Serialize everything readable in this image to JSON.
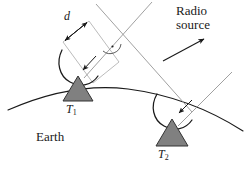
{
  "figure": {
    "width": 250,
    "height": 172,
    "background": "#ffffff"
  },
  "labels": {
    "radio_source_line1": "Radio",
    "radio_source_line2": "source",
    "earth": "Earth",
    "baseline_distance": "d",
    "telescope_1_base": "T",
    "telescope_1_sub": "1",
    "telescope_2_base": "T",
    "telescope_2_sub": "2"
  },
  "colors": {
    "ink": "#1a1a1a",
    "telescope_fill": "#808080",
    "telescope_stroke": "#333333",
    "wavefront_line": "#9a9a9a",
    "ray_line": "#8a8a8a",
    "earth_curve": "#1a1a1a",
    "background": "#ffffff"
  },
  "elements": {
    "earth_curve_name": "earth-surface-arc",
    "telescope_1_name": "telescope-t1",
    "telescope_2_name": "telescope-t2",
    "dish_1_name": "dish-arc-t1",
    "dish_2_name": "dish-arc-t2",
    "baseline_arrow_name": "baseline-distance-arrow",
    "right_angle_name": "right-angle-marker",
    "source_arrow_name": "radio-source-direction-arrow",
    "wavefront_name": "wavefront-line",
    "ray_t1_name": "incoming-ray-to-t1",
    "ray_t2_name": "incoming-ray-to-t2"
  },
  "geometry": {
    "baseline_arrow_from": [
      63,
      42
    ],
    "baseline_arrow_to": [
      89,
      21
    ],
    "right_angle_vertex": [
      112,
      48
    ],
    "source_arrow_from": [
      163,
      60
    ],
    "source_arrow_to": [
      205,
      38
    ],
    "telescope_1_apex": [
      78,
      75
    ],
    "telescope_2_apex": [
      172,
      118
    ]
  }
}
